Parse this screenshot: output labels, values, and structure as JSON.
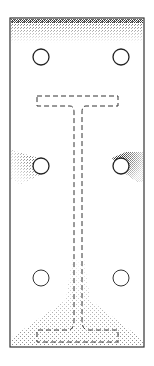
{
  "diagram": {
    "type": "base-plate-with-i-beam-stress-pattern",
    "plate": {
      "x": 10,
      "y": 18,
      "width": 134,
      "height": 329,
      "stroke": "#333333"
    },
    "holes": [
      {
        "id": "hole-top-left",
        "cx": 41,
        "cy": 57,
        "r": 8
      },
      {
        "id": "hole-top-right",
        "cx": 121,
        "cy": 57,
        "r": 8
      },
      {
        "id": "hole-mid-left",
        "cx": 41,
        "cy": 166,
        "r": 8
      },
      {
        "id": "hole-mid-right",
        "cx": 121,
        "cy": 166,
        "r": 8
      },
      {
        "id": "hole-bottom-left",
        "cx": 41,
        "cy": 278,
        "r": 8
      },
      {
        "id": "hole-bottom-right",
        "cx": 121,
        "cy": 278,
        "r": 8
      }
    ],
    "beam_outline": {
      "style": "dashed",
      "top_flange": {
        "x": 37,
        "y": 96,
        "width": 81,
        "height": 10
      },
      "web": {
        "x1": 74,
        "x2": 82
      },
      "bottom_flange": {
        "x": 37,
        "y": 330,
        "width": 81,
        "height": 12
      }
    },
    "stress_regions": [
      {
        "id": "top-edge-band",
        "intensity": "medium"
      },
      {
        "id": "mid-left-fan",
        "intensity": "medium"
      },
      {
        "id": "mid-right-fan",
        "intensity": "high"
      },
      {
        "id": "bottom-flange-spread",
        "intensity": "low"
      }
    ],
    "colors": {
      "line": "#333333",
      "stipple": "#555555",
      "background": "#ffffff"
    }
  }
}
